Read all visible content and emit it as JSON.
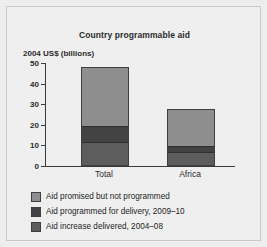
{
  "chart_data": {
    "type": "bar",
    "subtype": "stacked-bar",
    "title": "Country programmable aid",
    "ylabel": "2004 US$ (billions)",
    "xlabel": "",
    "categories": [
      "Total",
      "Africa"
    ],
    "ylim": [
      0,
      50
    ],
    "yticks": [
      0,
      10,
      20,
      30,
      40,
      50
    ],
    "ytick_labels": [
      "0",
      "10",
      "20",
      "30",
      "40",
      "50"
    ],
    "grid": false,
    "legend_position": "below",
    "series": [
      {
        "name": "Aid increase delivered, 2004–08",
        "values": [
          10.5,
          6.0
        ],
        "color": "#5d5d5d"
      },
      {
        "name": "Aid programmed for delivery, 2009–10",
        "values": [
          7.5,
          2.5
        ],
        "color": "#434343"
      },
      {
        "name": "Aid promised but not programmed",
        "values": [
          28.0,
          17.0
        ],
        "color": "#8e8e8e"
      }
    ],
    "totals": [
      46.0,
      25.5
    ],
    "legend_order": [
      "Aid promised but not programmed",
      "Aid programmed for delivery, 2009–10",
      "Aid increase delivered, 2004–08"
    ],
    "colors": {
      "promised": "#8e8e8e",
      "programmed": "#434343",
      "delivered": "#5d5d5d",
      "axis": "#3a3a3a",
      "text": "#2b2b2b",
      "background": "#efefef",
      "frame_border": "#c9c9c9"
    }
  }
}
